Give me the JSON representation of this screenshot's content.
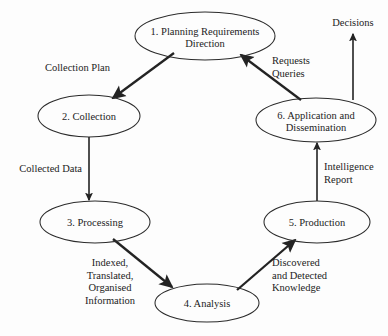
{
  "diagram": {
    "type": "cycle-flow-diagram",
    "background_color": "#fdfdfd",
    "line_color": "#232323",
    "text_color": "#1c1c1c",
    "nodes": [
      {
        "id": "node-1",
        "name": "planning-requirements-direction",
        "line1": "1. Planning Requirements",
        "line2": "Direction",
        "cx": 205,
        "cy": 36,
        "rx": 70,
        "ry": 24
      },
      {
        "id": "node-2",
        "name": "collection",
        "line1": "2. Collection",
        "line2": "",
        "cx": 89,
        "cy": 116,
        "rx": 51,
        "ry": 21
      },
      {
        "id": "node-6",
        "name": "application-and-dissemination",
        "line1": "6. Application and",
        "line2": "Dissemination",
        "cx": 316,
        "cy": 120,
        "rx": 60,
        "ry": 22
      },
      {
        "id": "node-3",
        "name": "processing",
        "line1": "3. Processing",
        "line2": "",
        "cx": 95,
        "cy": 222,
        "rx": 55,
        "ry": 21
      },
      {
        "id": "node-5",
        "name": "production",
        "line1": "5. Production",
        "line2": "",
        "cx": 317,
        "cy": 222,
        "rx": 53,
        "ry": 21
      },
      {
        "id": "node-4",
        "name": "analysis",
        "line1": "4. Analysis",
        "line2": "",
        "cx": 207,
        "cy": 303,
        "rx": 52,
        "ry": 19
      }
    ],
    "terminals": [
      {
        "id": "terminal-decisions",
        "name": "decisions",
        "label": "Decisions",
        "x": 353,
        "y": 26
      }
    ],
    "edges": [
      {
        "id": "edge-1-to-2",
        "name": "collection-plan",
        "from": "node-1",
        "to": "node-2",
        "x1": 174,
        "y1": 53,
        "x2": 113,
        "y2": 98,
        "weight": "thick",
        "label_lines": [
          "Collection Plan"
        ],
        "label_x": 110,
        "label_y": 71,
        "label_align": "end"
      },
      {
        "id": "edge-2-to-3",
        "name": "collected-data",
        "from": "node-2",
        "to": "node-3",
        "x1": 89,
        "y1": 137,
        "x2": 89,
        "y2": 200,
        "weight": "thin",
        "label_lines": [
          "Collected Data"
        ],
        "label_x": 82,
        "label_y": 172,
        "label_align": "end"
      },
      {
        "id": "edge-3-to-4",
        "name": "indexed-translated-organised-information",
        "from": "node-3",
        "to": "node-4",
        "x1": 113,
        "y1": 239,
        "x2": 172,
        "y2": 287,
        "weight": "thick",
        "label_lines": [
          "Indexed,",
          "Translated,",
          "Organised",
          "Information"
        ],
        "label_x": 110,
        "label_y": 266,
        "label_align": "center"
      },
      {
        "id": "edge-4-to-5",
        "name": "discovered-and-detected-knowledge",
        "from": "node-4",
        "to": "node-5",
        "x1": 237,
        "y1": 290,
        "x2": 295,
        "y2": 240,
        "weight": "thick",
        "label_lines": [
          "Discovered",
          "and Detected",
          "Knowledge"
        ],
        "label_x": 272,
        "label_y": 266,
        "label_align": "start"
      },
      {
        "id": "edge-5-to-6",
        "name": "intelligence-report",
        "from": "node-5",
        "to": "node-6",
        "x1": 317,
        "y1": 201,
        "x2": 317,
        "y2": 143,
        "weight": "thin",
        "label_lines": [
          "Intelligence",
          "Report"
        ],
        "label_x": 324,
        "label_y": 170,
        "label_align": "start"
      },
      {
        "id": "edge-6-to-1",
        "name": "requests-queries",
        "from": "node-6",
        "to": "node-1",
        "x1": 301,
        "y1": 100,
        "x2": 241,
        "y2": 55,
        "weight": "thick",
        "label_lines": [
          "Requests",
          "Queries"
        ],
        "label_x": 272,
        "label_y": 64,
        "label_align": "start"
      },
      {
        "id": "edge-6-to-decisions",
        "name": "decisions-output",
        "from": "node-6",
        "to": "terminal-decisions",
        "x1": 353,
        "y1": 100,
        "x2": 353,
        "y2": 34,
        "weight": "thin",
        "label_lines": [],
        "label_x": 0,
        "label_y": 0,
        "label_align": "center"
      }
    ]
  }
}
